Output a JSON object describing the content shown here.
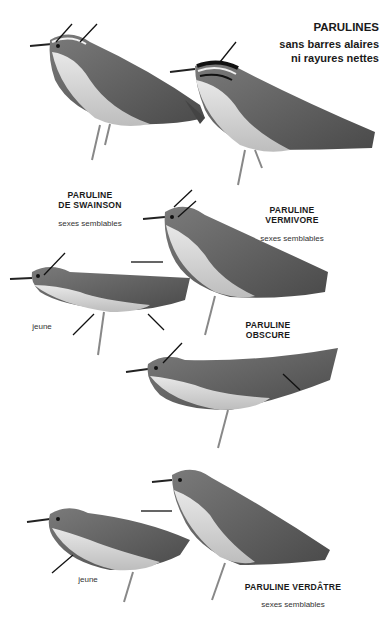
{
  "plate": {
    "title": "PARULINES",
    "subtitle_line1": "sans barres alaires",
    "subtitle_line2": "ni rayures nettes"
  },
  "species": [
    {
      "name_line1": "PARULINE",
      "name_line2": "DE SWAINSON",
      "note": "sexes semblables"
    },
    {
      "name_line1": "PARULINE",
      "name_line2": "VERMIVORE",
      "note": "sexes semblables"
    },
    {
      "name_line1": "PARULINE",
      "name_line2": "OBSCURE",
      "juvenile_label": "jeune"
    },
    {
      "name_line1": "PARULINE VERDÂTRE",
      "note": "sexes semblables",
      "juvenile_label": "jeune"
    }
  ],
  "colors": {
    "ink": "#1a1a1a",
    "bird_dark": "#555555",
    "bird_mid": "#8a8a8a",
    "bird_light": "#d6d6d6",
    "background": "#ffffff"
  }
}
